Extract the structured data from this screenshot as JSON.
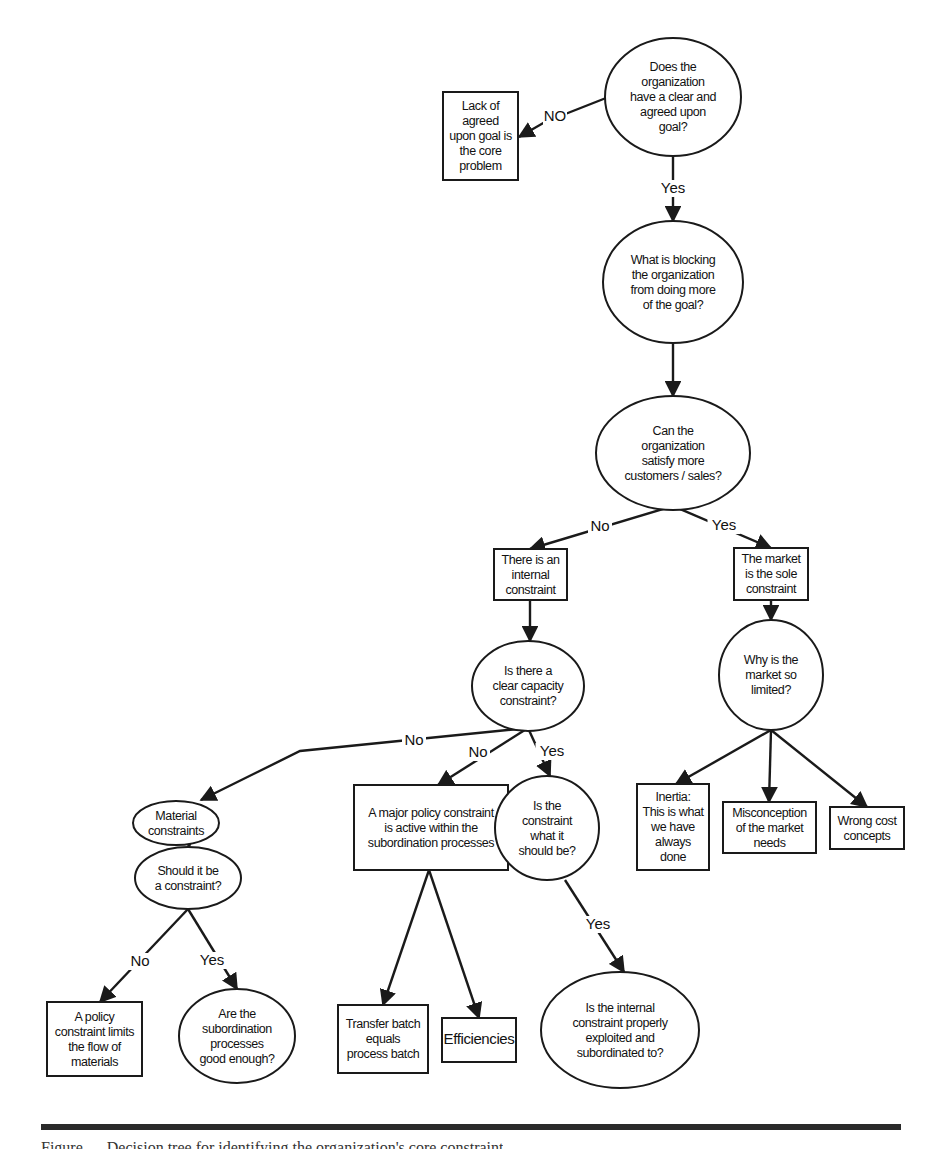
{
  "diagram": {
    "nodes": [
      {
        "id": "goal_q",
        "shape": "ellipse",
        "cx": 673,
        "cy": 97,
        "rx": 68,
        "ry": 59,
        "lines": [
          "Does the",
          "organization",
          "have a clear and",
          "agreed upon",
          "goal?"
        ]
      },
      {
        "id": "no_goal",
        "shape": "rect",
        "x": 443,
        "y": 92,
        "w": 75,
        "h": 88,
        "lines": [
          "Lack of",
          "agreed",
          "upon goal is",
          "the core",
          "problem"
        ]
      },
      {
        "id": "blocking_q",
        "shape": "ellipse",
        "cx": 673,
        "cy": 282,
        "rx": 70,
        "ry": 61,
        "lines": [
          "What is blocking",
          "the organization",
          "from doing more",
          "of the goal?"
        ]
      },
      {
        "id": "customers_q",
        "shape": "ellipse",
        "cx": 673,
        "cy": 453,
        "rx": 77,
        "ry": 57,
        "lines": [
          "Can the",
          "organization",
          "satisfy more",
          "customers / sales?"
        ]
      },
      {
        "id": "internal",
        "shape": "rect",
        "x": 494,
        "y": 549,
        "w": 73,
        "h": 51,
        "lines": [
          "There is an",
          "internal",
          "constraint"
        ]
      },
      {
        "id": "market_sole",
        "shape": "rect",
        "x": 734,
        "y": 548,
        "w": 74,
        "h": 52,
        "lines": [
          "The market",
          "is the sole",
          "constraint"
        ]
      },
      {
        "id": "capacity_q",
        "shape": "ellipse",
        "cx": 528,
        "cy": 686,
        "rx": 56,
        "ry": 45,
        "lines": [
          "Is there a",
          "clear capacity",
          "constraint?"
        ]
      },
      {
        "id": "market_q",
        "shape": "ellipse",
        "cx": 771,
        "cy": 675,
        "rx": 52,
        "ry": 55,
        "lines": [
          "Why is the",
          "market so",
          "limited?"
        ]
      },
      {
        "id": "material",
        "shape": "ellipse",
        "cx": 176,
        "cy": 823,
        "rx": 43,
        "ry": 22,
        "lines": [
          "Material",
          "constraints"
        ]
      },
      {
        "id": "policy_major",
        "shape": "rect",
        "x": 354,
        "y": 785,
        "w": 154,
        "h": 85,
        "lines": [
          "A major policy constraint",
          "is active within the",
          "subordination processes"
        ]
      },
      {
        "id": "what_should_q",
        "shape": "ellipse",
        "cx": 547,
        "cy": 828,
        "rx": 52,
        "ry": 52,
        "lines": [
          "Is the",
          "constraint",
          "what it",
          "should be?"
        ]
      },
      {
        "id": "inertia",
        "shape": "rect",
        "x": 637,
        "y": 784,
        "w": 72,
        "h": 86,
        "lines": [
          "Inertia:",
          "This is what",
          "we have",
          "always",
          "done"
        ]
      },
      {
        "id": "misconception",
        "shape": "rect",
        "x": 723,
        "y": 802,
        "w": 93,
        "h": 51,
        "lines": [
          "Misconception",
          "of the market",
          "needs"
        ]
      },
      {
        "id": "wrong_cost",
        "shape": "rect",
        "x": 830,
        "y": 807,
        "w": 74,
        "h": 42,
        "lines": [
          "Wrong cost",
          "concepts"
        ]
      },
      {
        "id": "should_q",
        "shape": "ellipse",
        "cx": 188,
        "cy": 878,
        "rx": 53,
        "ry": 31,
        "lines": [
          "Should it be",
          "a constraint?"
        ]
      },
      {
        "id": "policy_flow",
        "shape": "rect",
        "x": 47,
        "y": 1002,
        "w": 95,
        "h": 74,
        "lines": [
          "A policy",
          "constraint limits",
          "the flow of",
          "materials"
        ]
      },
      {
        "id": "subordination_q",
        "shape": "ellipse",
        "cx": 237,
        "cy": 1036,
        "rx": 58,
        "ry": 47,
        "lines": [
          "Are the",
          "subordination",
          "processes",
          "good enough?"
        ]
      },
      {
        "id": "transfer_batch",
        "shape": "rect",
        "x": 338,
        "y": 1005,
        "w": 90,
        "h": 68,
        "lines": [
          "Transfer batch",
          "equals",
          "process batch"
        ]
      },
      {
        "id": "efficiencies",
        "shape": "rect",
        "x": 442,
        "y": 1018,
        "w": 74,
        "h": 44,
        "lines": [
          "Efficiencies"
        ]
      },
      {
        "id": "exploited_q",
        "shape": "ellipse",
        "cx": 620,
        "cy": 1030,
        "rx": 79,
        "ry": 58,
        "lines": [
          "Is the internal",
          "constraint properly",
          "exploited and",
          "subordinated to?"
        ]
      }
    ],
    "edges": [
      {
        "from": "goal_q",
        "to": "no_goal",
        "label": "NO",
        "points": [
          [
            606,
            98
          ],
          [
            545,
            122
          ],
          [
            519,
            137
          ]
        ],
        "label_x": 555,
        "label_y": 121
      },
      {
        "from": "goal_q",
        "to": "blocking_q",
        "label": "Yes",
        "points": [
          [
            673,
            157
          ],
          [
            673,
            221
          ]
        ],
        "label_x": 673,
        "label_y": 193
      },
      {
        "from": "blocking_q",
        "to": "customers_q",
        "label": "",
        "points": [
          [
            673,
            344
          ],
          [
            673,
            396
          ]
        ],
        "label_x": 0,
        "label_y": 0
      },
      {
        "from": "customers_q",
        "to": "internal",
        "label": "No",
        "points": [
          [
            673,
            506
          ],
          [
            530,
            549
          ]
        ],
        "label_x": 600,
        "label_y": 531
      },
      {
        "from": "customers_q",
        "to": "market_sole",
        "label": "Yes",
        "points": [
          [
            673,
            506
          ],
          [
            771,
            548
          ]
        ],
        "label_x": 724,
        "label_y": 530
      },
      {
        "from": "internal",
        "to": "capacity_q",
        "label": "",
        "points": [
          [
            530,
            600
          ],
          [
            530,
            641
          ]
        ],
        "label_x": 0,
        "label_y": 0
      },
      {
        "from": "market_sole",
        "to": "market_q",
        "label": "",
        "points": [
          [
            771,
            600
          ],
          [
            771,
            620
          ]
        ],
        "label_x": 0,
        "label_y": 0
      },
      {
        "from": "capacity_q",
        "to": "material",
        "label": "No",
        "points": [
          [
            528,
            728
          ],
          [
            300,
            751
          ],
          [
            201,
            800
          ]
        ],
        "label_x": 414,
        "label_y": 745
      },
      {
        "from": "capacity_q",
        "to": "policy_major",
        "label": "No",
        "points": [
          [
            528,
            728
          ],
          [
            438,
            785
          ]
        ],
        "label_x": 478,
        "label_y": 757
      },
      {
        "from": "capacity_q",
        "to": "what_should_q",
        "label": "Yes",
        "points": [
          [
            528,
            728
          ],
          [
            550,
            776
          ]
        ],
        "label_x": 552,
        "label_y": 756
      },
      {
        "from": "market_q",
        "to": "inertia",
        "label": "",
        "points": [
          [
            771,
            730
          ],
          [
            676,
            784
          ]
        ],
        "label_x": 0,
        "label_y": 0
      },
      {
        "from": "market_q",
        "to": "misconception",
        "label": "",
        "points": [
          [
            771,
            730
          ],
          [
            769,
            802
          ]
        ],
        "label_x": 0,
        "label_y": 0
      },
      {
        "from": "market_q",
        "to": "wrong_cost",
        "label": "",
        "points": [
          [
            771,
            730
          ],
          [
            867,
            807
          ]
        ],
        "label_x": 0,
        "label_y": 0
      },
      {
        "from": "material",
        "to": "should_q",
        "label": "",
        "points": [
          [
            189,
            845
          ],
          [
            189,
            847
          ]
        ],
        "label_x": 0,
        "label_y": 0
      },
      {
        "from": "should_q",
        "to": "policy_flow",
        "label": "No",
        "points": [
          [
            188,
            909
          ],
          [
            100,
            1002
          ]
        ],
        "label_x": 140,
        "label_y": 966
      },
      {
        "from": "should_q",
        "to": "subordination_q",
        "label": "Yes",
        "points": [
          [
            188,
            909
          ],
          [
            237,
            989
          ]
        ],
        "label_x": 212,
        "label_y": 965
      },
      {
        "from": "policy_major",
        "to": "transfer_batch",
        "label": "",
        "points": [
          [
            429,
            870
          ],
          [
            383,
            1005
          ]
        ],
        "label_x": 0,
        "label_y": 0
      },
      {
        "from": "policy_major",
        "to": "efficiencies",
        "label": "",
        "points": [
          [
            429,
            870
          ],
          [
            479,
            1018
          ]
        ],
        "label_x": 0,
        "label_y": 0
      },
      {
        "from": "what_should_q",
        "to": "exploited_q",
        "label": "Yes",
        "points": [
          [
            565,
            880
          ],
          [
            624,
            972
          ]
        ],
        "label_x": 598,
        "label_y": 929
      }
    ]
  },
  "footer": {
    "caption": "Figure — Decision tree for identifying the organization's core constraint"
  }
}
